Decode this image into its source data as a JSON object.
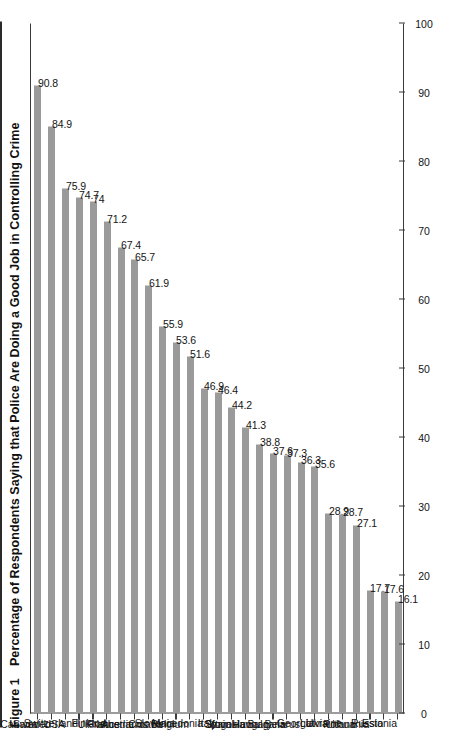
{
  "figure": {
    "label": "Figure 1",
    "title": "Percentage of Respondents Saying that Police Are Doing a Good Job in Controlling Crime"
  },
  "colors": {
    "bar": "#9a9a9a",
    "axis": "#3a3a3a",
    "text": "#141414",
    "background": "#ffffff"
  },
  "chart_data": {
    "type": "bar",
    "orientation": "vertical",
    "xlabel": "",
    "ylabel": "",
    "ylim": [
      0,
      100
    ],
    "yticks": [
      0,
      10,
      20,
      30,
      40,
      50,
      60,
      70,
      80,
      90,
      100
    ],
    "grid": false,
    "legend": false,
    "categories": [
      "Canada",
      "Sweden",
      "USA",
      "Switzerland",
      "UK",
      "Finland",
      "France",
      "Austria",
      "Netherlands",
      "Croatia",
      "Slovenia",
      "Belgium",
      "Macedonia",
      "Italy",
      "Spain",
      "Slovakia",
      "Yugoslavia",
      "Hungary",
      "Bulgaria",
      "Belarus",
      "Georgia",
      "Latvia",
      "Ukraine",
      "Poland",
      "Lithuania",
      "Russia",
      "Estonia"
    ],
    "values": [
      90.8,
      84.9,
      75.9,
      74.7,
      74,
      71.2,
      67.4,
      65.7,
      61.9,
      55.9,
      53.6,
      51.6,
      46.9,
      46.4,
      44.2,
      41.3,
      38.8,
      37.6,
      37.3,
      36.3,
      35.6,
      28.9,
      28.7,
      27.1,
      17.7,
      17.6,
      16.1
    ],
    "value_labels": [
      "90.8",
      "84.9",
      "75.9",
      "74.7",
      "74",
      "71.2",
      "67.4",
      "65.7",
      "61.9",
      "55.9",
      "53.6",
      "51.6",
      "46.9",
      "46.4",
      "44.2",
      "41.3",
      "38.8",
      "37.6",
      "37.3",
      "36.3",
      "35.6",
      "28.9",
      "28.7",
      "27.1",
      "17.7",
      "17.6",
      "16.1"
    ],
    "tick_labels": [
      "0",
      "10",
      "20",
      "30",
      "40",
      "50",
      "60",
      "70",
      "80",
      "90",
      "100"
    ]
  }
}
